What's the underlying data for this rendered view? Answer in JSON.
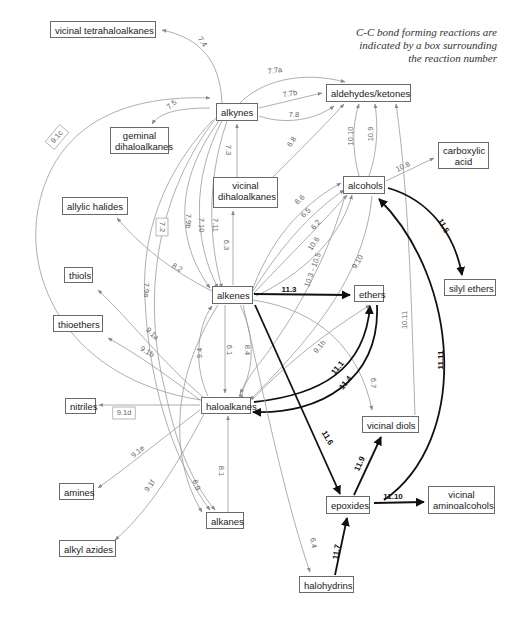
{
  "note": {
    "lines": [
      "C-C bond forming reactions are",
      "indicated by a box surrounding",
      "the reaction number"
    ]
  },
  "nodes": [
    {
      "id": "vicinal_tetrahaloalkanes",
      "label": "vicinal tetrahaloalkanes",
      "x": 50,
      "y": 21,
      "w": 106,
      "h": 17
    },
    {
      "id": "alkynes",
      "label": "alkynes",
      "x": 216,
      "y": 103,
      "w": 42,
      "h": 18
    },
    {
      "id": "aldehydes_ketones",
      "label": "aldehydes/ketones",
      "x": 326,
      "y": 84,
      "w": 85,
      "h": 18
    },
    {
      "id": "geminal_dihaloalkanes",
      "label": "geminal\ndihaloalkanes",
      "x": 110,
      "y": 127,
      "w": 59,
      "h": 27
    },
    {
      "id": "carboxylic_acid",
      "label": "carboxylic\nacid",
      "x": 438,
      "y": 142,
      "w": 51,
      "h": 27
    },
    {
      "id": "vicinal_dihaloalkanes",
      "label": "vicinal\ndihaloalkanes",
      "x": 213,
      "y": 177,
      "w": 65,
      "h": 31
    },
    {
      "id": "alcohols",
      "label": "alcohols",
      "x": 343,
      "y": 176,
      "w": 42,
      "h": 18
    },
    {
      "id": "allylic_halides",
      "label": "allylic halides",
      "x": 62,
      "y": 197,
      "w": 66,
      "h": 18
    },
    {
      "id": "silyl_ethers",
      "label": "silyl ethers",
      "x": 444,
      "y": 279,
      "w": 52,
      "h": 17
    },
    {
      "id": "thiols",
      "label": "thiols",
      "x": 64,
      "y": 267,
      "w": 29,
      "h": 16
    },
    {
      "id": "alkenes",
      "label": "alkenes",
      "x": 212,
      "y": 286,
      "w": 41,
      "h": 18
    },
    {
      "id": "ethers",
      "label": "ethers",
      "x": 354,
      "y": 285,
      "w": 30,
      "h": 17
    },
    {
      "id": "thioethers",
      "label": "thioethers",
      "x": 53,
      "y": 315,
      "w": 50,
      "h": 17
    },
    {
      "id": "nitriles",
      "label": "nitriles",
      "x": 65,
      "y": 398,
      "w": 31,
      "h": 16
    },
    {
      "id": "haloalkanes",
      "label": "haloalkanes",
      "x": 201,
      "y": 397,
      "w": 50,
      "h": 17
    },
    {
      "id": "vicinal_diols",
      "label": "vicinal diols",
      "x": 362,
      "y": 416,
      "w": 57,
      "h": 17
    },
    {
      "id": "amines",
      "label": "amines",
      "x": 59,
      "y": 483,
      "w": 35,
      "h": 17
    },
    {
      "id": "epoxides",
      "label": "epoxides",
      "x": 326,
      "y": 496,
      "w": 44,
      "h": 18
    },
    {
      "id": "vicinal_aminoalcohols",
      "label": "vicinal\naminoalcohols",
      "x": 428,
      "y": 486,
      "w": 67,
      "h": 28
    },
    {
      "id": "alkanes",
      "label": "alkanes",
      "x": 206,
      "y": 512,
      "w": 38,
      "h": 17
    },
    {
      "id": "alkyl_azides",
      "label": "alkyl azides",
      "x": 59,
      "y": 540,
      "w": 57,
      "h": 17
    },
    {
      "id": "halohydrins",
      "label": "halohydrins",
      "x": 299,
      "y": 576,
      "w": 55,
      "h": 17
    }
  ],
  "edges": [
    {
      "id": "7.4",
      "label": "7.4",
      "path": "M222,103 C220,60 200,38 162,30",
      "lx": 202,
      "ly": 42,
      "rot": 55,
      "style": "thin"
    },
    {
      "id": "7.5",
      "label": "7.5",
      "path": "M210,108 C180,108 160,112 152,124",
      "lx": 172,
      "ly": 105,
      "rot": -40,
      "style": "thin"
    },
    {
      "id": "9.1c",
      "label": "9.1c",
      "path": "M201,400 C70,380 20,280 40,200 C60,120 130,95 210,98",
      "lx": 57,
      "ly": 137,
      "rot": -50,
      "style": "thin",
      "boxed": true
    },
    {
      "id": "7.7a",
      "label": "7.7a",
      "path": "M240,103 C260,82 300,70 345,82",
      "lx": 275,
      "ly": 71,
      "rot": -8,
      "style": "thin"
    },
    {
      "id": "7.7b",
      "label": "7.7b",
      "path": "M259,108 L322,93",
      "lx": 290,
      "ly": 94,
      "rot": -10,
      "style": "thin"
    },
    {
      "id": "7.8",
      "label": "7.8",
      "path": "M259,116 C285,125 315,120 334,106",
      "lx": 294,
      "ly": 115,
      "rot": 0,
      "style": "thin"
    },
    {
      "id": "7.3",
      "label": "7.3",
      "path": "M237,177 L237,124",
      "lx": 228,
      "ly": 150,
      "rot": 90,
      "style": "thin"
    },
    {
      "id": "6.8",
      "label": "6.8",
      "path": "M270,180 C300,150 325,125 344,104",
      "lx": 292,
      "ly": 142,
      "rot": -55,
      "style": "thin"
    },
    {
      "id": "10.10",
      "label": "10.10",
      "path": "M359,176 C352,150 352,125 359,104",
      "lx": 351,
      "ly": 136,
      "rot": -90,
      "style": "thin"
    },
    {
      "id": "10.9",
      "label": "10.9",
      "path": "M369,176 C378,150 378,125 375,104",
      "lx": 371,
      "ly": 134,
      "rot": -90,
      "style": "thin"
    },
    {
      "id": "10.11",
      "label": "10.11",
      "path": "M415,415 C412,330 410,200 396,104",
      "lx": 405,
      "ly": 320,
      "rot": -90,
      "style": "thin"
    },
    {
      "id": "10.8",
      "label": "10.8",
      "path": "M386,181 L434,158",
      "lx": 403,
      "ly": 167,
      "rot": -25,
      "style": "thin"
    },
    {
      "id": "7.2",
      "label": "7.2",
      "path": "M213,120 C175,160 140,220 145,300 C150,400 180,470 210,510",
      "lx": 162,
      "ly": 227,
      "rot": 90,
      "style": "thin",
      "boxed": true
    },
    {
      "id": "7.9a",
      "label": "7.9a",
      "path": "M216,118 C160,190 140,290 165,390 C175,440 190,480 215,510",
      "lx": 146,
      "ly": 290,
      "rot": 90,
      "style": "thin"
    },
    {
      "id": "7.9b",
      "label": "7.9b",
      "path": "M219,121 C175,180 175,240 210,288",
      "lx": 188,
      "ly": 221,
      "rot": 90,
      "style": "thin"
    },
    {
      "id": "7.10",
      "label": "7.10",
      "path": "M222,121 C190,180 195,245 218,288",
      "lx": 201,
      "ly": 225,
      "rot": 90,
      "style": "thin"
    },
    {
      "id": "7.11",
      "label": "7.11",
      "path": "M227,121 C205,185 210,245 222,288",
      "lx": 215,
      "ly": 225,
      "rot": 90,
      "style": "thin"
    },
    {
      "id": "6.3",
      "label": "6.3",
      "path": "M233,285 L233,211",
      "lx": 226,
      "ly": 245,
      "rot": 90,
      "style": "thin"
    },
    {
      "id": "8.2",
      "label": "8.2",
      "path": "M212,291 C170,270 140,245 117,218",
      "lx": 177,
      "ly": 268,
      "rot": 30,
      "style": "thin"
    },
    {
      "id": "6.6",
      "label": "6.6",
      "path": "M253,288 C275,230 310,200 341,183",
      "lx": 300,
      "ly": 200,
      "rot": -40,
      "style": "thin"
    },
    {
      "id": "6.5",
      "label": "6.5",
      "path": "M253,291 C285,240 315,210 344,190",
      "lx": 306,
      "ly": 213,
      "rot": -45,
      "style": "thin"
    },
    {
      "id": "6.2",
      "label": "6.2",
      "path": "M253,294 C290,255 320,225 347,195",
      "lx": 316,
      "ly": 225,
      "rot": -50,
      "style": "thin"
    },
    {
      "id": "10.6",
      "label": "10.6",
      "path": "M256,296 C300,275 340,240 352,195",
      "lx": 314,
      "ly": 244,
      "rot": -55,
      "style": "thin"
    },
    {
      "id": "10.3-10.5",
      "label": "10.3 - 10.5",
      "path": "M345,196 C330,250 300,310 262,360 C245,380 240,395 243,397",
      "lx": 313,
      "ly": 270,
      "rot": -70,
      "style": "thin"
    },
    {
      "id": "9.10",
      "label": "9.10",
      "path": "M372,196 C365,270 320,330 250,400",
      "lx": 358,
      "ly": 262,
      "rot": -60,
      "style": "thin"
    },
    {
      "id": "11.3",
      "label": "11.3",
      "path": "M254,294 L350,295",
      "lx": 289,
      "ly": 290,
      "rot": 0,
      "style": "bold"
    },
    {
      "id": "11.5",
      "label": "11.5",
      "path": "M388,188 C430,200 455,235 462,275",
      "lx": 443,
      "ly": 226,
      "rot": 60,
      "style": "bold"
    },
    {
      "id": "11.11",
      "label": "11.11",
      "path": "M384,500 C470,440 460,280 379,199",
      "lx": 441,
      "ly": 360,
      "rot": -90,
      "style": "bold"
    },
    {
      "id": "9.1a",
      "label": "9.1a",
      "path": "M204,398 C160,360 130,320 98,290",
      "lx": 152,
      "ly": 334,
      "rot": 45,
      "style": "thin"
    },
    {
      "id": "9.1b",
      "label": "9.1b",
      "path": "M200,400 C160,370 130,350 108,338",
      "lx": 147,
      "ly": 352,
      "rot": 30,
      "style": "thin"
    },
    {
      "id": "9.4",
      "label": "9.4",
      "path": "M208,396 C195,370 195,330 212,306",
      "lx": 200,
      "ly": 353,
      "rot": -90,
      "style": "thin"
    },
    {
      "id": "6.1",
      "label": "6.1",
      "path": "M225,305 L225,393",
      "lx": 229,
      "ly": 350,
      "rot": 90,
      "style": "thin"
    },
    {
      "id": "8.4",
      "label": "8.4",
      "path": "M240,305 C255,335 255,370 240,393",
      "lx": 247,
      "ly": 350,
      "rot": 90,
      "style": "thin"
    },
    {
      "id": "9.1h",
      "label": "9.1h",
      "path": "M252,400 C290,360 330,330 370,305",
      "lx": 320,
      "ly": 347,
      "rot": -50,
      "style": "thin"
    },
    {
      "id": "6.7",
      "label": "6.7",
      "path": "M253,300 C320,310 360,350 372,410",
      "lx": 373,
      "ly": 383,
      "rot": 90,
      "style": "thin"
    },
    {
      "id": "11.1",
      "label": "11.1",
      "path": "M254,402 C320,395 365,370 370,306",
      "lx": 338,
      "ly": 368,
      "rot": -50,
      "style": "bold"
    },
    {
      "id": "11.4",
      "label": "11.4",
      "path": "M377,305 C380,380 320,415 253,412",
      "lx": 346,
      "ly": 383,
      "rot": -50,
      "style": "bold"
    },
    {
      "id": "11.6",
      "label": "11.6",
      "path": "M255,305 L340,494",
      "lx": 327,
      "ly": 438,
      "rot": 60,
      "style": "bold"
    },
    {
      "id": "9.1d",
      "label": "9.1d",
      "path": "M200,405 L99,405",
      "lx": 124,
      "ly": 413,
      "rot": 0,
      "style": "thin",
      "boxed": true
    },
    {
      "id": "9.1e",
      "label": "9.1e",
      "path": "M200,410 C160,440 130,465 98,488",
      "lx": 138,
      "ly": 452,
      "rot": -40,
      "style": "thin"
    },
    {
      "id": "9.1f",
      "label": "9.1f",
      "path": "M204,414 C180,460 150,510 115,540",
      "lx": 150,
      "ly": 486,
      "rot": -55,
      "style": "thin"
    },
    {
      "id": "8.1",
      "label": "8.1",
      "path": "M228,512 L228,416",
      "lx": 221,
      "ly": 471,
      "rot": 90,
      "style": "thin"
    },
    {
      "id": "6.9",
      "label": "6.9",
      "path": "M218,305 C170,380 170,460 202,512",
      "lx": 196,
      "ly": 485,
      "rot": 70,
      "style": "thin"
    },
    {
      "id": "6.4",
      "label": "6.4",
      "path": "M243,305 C265,400 285,500 310,572",
      "lx": 313,
      "ly": 543,
      "rot": 80,
      "style": "thin"
    },
    {
      "id": "11.9",
      "label": "11.9",
      "path": "M354,495 L381,437",
      "lx": 360,
      "ly": 464,
      "rot": -65,
      "style": "bold"
    },
    {
      "id": "11.10",
      "label": "11.10",
      "path": "M374,503 L424,502",
      "lx": 393,
      "ly": 497,
      "rot": 0,
      "style": "bold"
    },
    {
      "id": "11.7",
      "label": "11.7",
      "path": "M335,575 L347,518",
      "lx": 337,
      "ly": 552,
      "rot": -80,
      "style": "bold"
    }
  ]
}
